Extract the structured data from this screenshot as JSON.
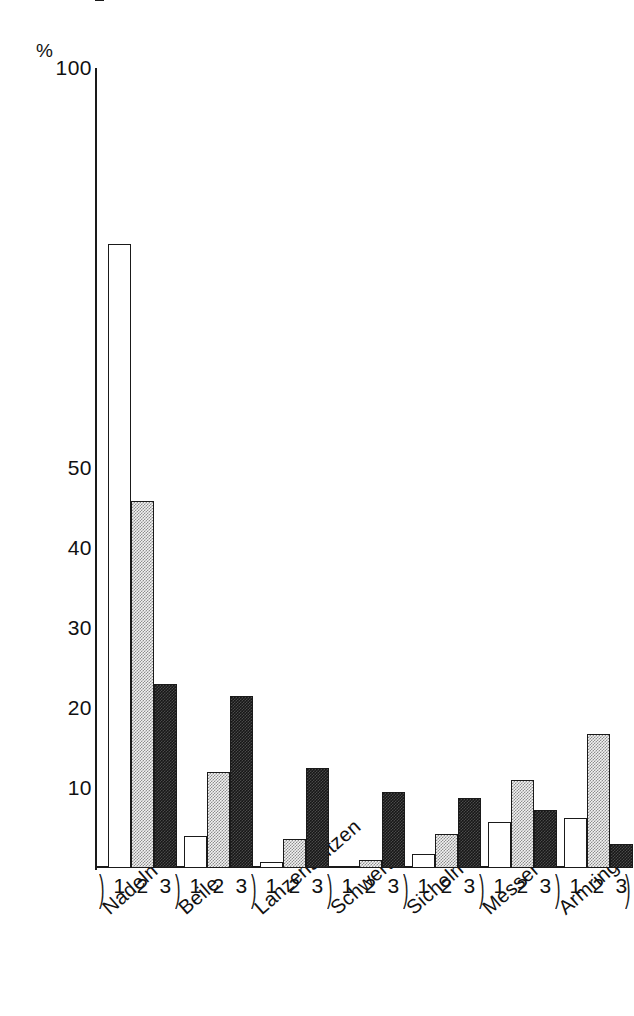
{
  "chart_data": {
    "type": "bar",
    "title": "",
    "subtitle": "",
    "xlabel": "",
    "ylabel": "%",
    "ylim": [
      0,
      100
    ],
    "yticks": [
      100,
      50,
      40,
      30,
      20,
      10
    ],
    "grid": false,
    "legend": "none",
    "categories": [
      "Nadeln",
      "Beile",
      "Lanzenspitzen",
      "Schwerter",
      "Sicheln",
      "Messer",
      "Armringe"
    ],
    "subcategories": [
      "1",
      "2",
      "3"
    ],
    "series": [
      {
        "name": "1",
        "fill": "white",
        "values": [
          78.0,
          4.0,
          0.8,
          0.3,
          1.8,
          5.8,
          6.3
        ]
      },
      {
        "name": "2",
        "fill": "gray",
        "values": [
          45.9,
          12.0,
          3.6,
          1.0,
          4.2,
          11.0,
          16.7
        ]
      },
      {
        "name": "3",
        "fill": "dark",
        "values": [
          23.0,
          21.5,
          12.5,
          9.5,
          8.8,
          7.3,
          3.0
        ]
      }
    ],
    "colors": {
      "axis": "#1a1a1a",
      "fill_white": "#ffffff",
      "fill_gray": "#cfcfcf",
      "fill_dark": "#1a1a1a",
      "background": "#ffffff"
    }
  },
  "axis": {
    "unit_label": "%",
    "ticks": [
      "100",
      "50",
      "40",
      "30",
      "20",
      "10"
    ]
  },
  "groups": [
    {
      "label": "Nadeln",
      "ticks": [
        "1",
        "2",
        "3"
      ]
    },
    {
      "label": "Beile",
      "ticks": [
        "1",
        "2",
        "3"
      ]
    },
    {
      "label": "Lanzenspitzen",
      "ticks": [
        "1",
        "2",
        "3"
      ]
    },
    {
      "label": "Schwerter",
      "ticks": [
        "1",
        "2",
        "3"
      ]
    },
    {
      "label": "Sicheln",
      "ticks": [
        "1",
        "2",
        "3"
      ]
    },
    {
      "label": "Messer",
      "ticks": [
        "1",
        "2",
        "3"
      ]
    },
    {
      "label": "Armringe",
      "ticks": [
        "1",
        "2",
        "3"
      ]
    }
  ]
}
